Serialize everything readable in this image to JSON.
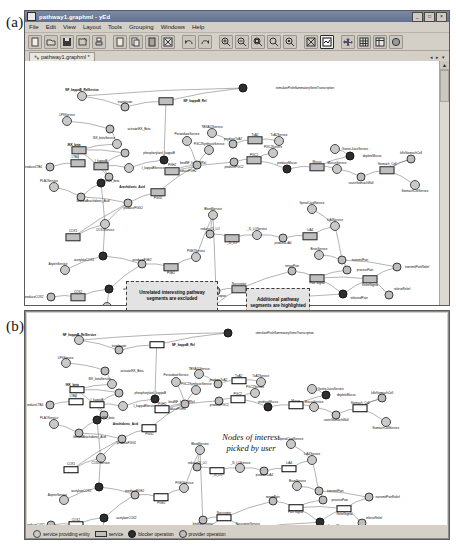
{
  "figure": {
    "panel_a_label": "(a)",
    "panel_b_label": "(b)"
  },
  "window": {
    "title": "pathway1.graphml - yEd",
    "icon": "graph-document-icon",
    "buttons": [
      {
        "name": "minimize-button",
        "glyph": "_"
      },
      {
        "name": "maximize-button",
        "glyph": "□"
      },
      {
        "name": "close-button",
        "glyph": "×"
      }
    ],
    "menus": [
      "File",
      "Edit",
      "View",
      "Layout",
      "Tools",
      "Grouping",
      "Windows",
      "Help"
    ],
    "toolbar": [
      {
        "name": "new-document-button",
        "icon": "new-file-icon"
      },
      {
        "name": "open-document-button",
        "icon": "open-folder-icon"
      },
      {
        "name": "save-document-button",
        "icon": "save-disk-icon"
      },
      {
        "name": "save-as-button",
        "icon": "save-as-icon"
      },
      {
        "name": "print-button",
        "icon": "printer-icon"
      },
      {
        "name": "cut-button",
        "icon": "cut-scissors-icon"
      },
      {
        "name": "copy-button",
        "icon": "copy-pages-icon"
      },
      {
        "name": "paste-button",
        "icon": "paste-clipboard-icon"
      },
      {
        "name": "delete-button",
        "icon": "delete-x-icon"
      },
      {
        "name": "undo-button",
        "icon": "undo-arrow-icon"
      },
      {
        "name": "redo-button",
        "icon": "redo-arrow-icon"
      },
      {
        "name": "zoom-in-button",
        "icon": "zoom-in-icon"
      },
      {
        "name": "zoom-out-button",
        "icon": "zoom-out-icon"
      },
      {
        "name": "zoom-area-button",
        "icon": "zoom-area-icon"
      },
      {
        "name": "zoom-original-button",
        "icon": "zoom-100-icon"
      },
      {
        "name": "zoom-selection-button",
        "icon": "zoom-selection-icon"
      },
      {
        "name": "fit-content-button",
        "icon": "fit-content-icon"
      },
      {
        "name": "fit-page-button",
        "icon": "fit-page-icon"
      },
      {
        "name": "move-tool-button",
        "icon": "move-cross-icon"
      },
      {
        "name": "grid-button",
        "icon": "grid-icon"
      },
      {
        "name": "table-layout-button",
        "icon": "table-icon"
      },
      {
        "name": "properties-button",
        "icon": "properties-circle-icon"
      }
    ],
    "tab": {
      "label": "pathway1.graphml *",
      "icon": "graph-tab-icon"
    },
    "tab_controls": [
      "◂",
      "▸",
      "▾"
    ],
    "scroll": {
      "up_arrow": "▲",
      "down_arrow": "▼"
    }
  },
  "annotations": {
    "callout_excluded": "Unrelated interesting pathway segments are excluded",
    "callout_highlighted": "Additional pathway segments are highlighted",
    "hand_note": "Nodes of interest\npicked by user"
  },
  "legend": {
    "items": [
      {
        "label": "service providing entity",
        "shape": "circle",
        "name": "legend-entity"
      },
      {
        "label": "service",
        "shape": "rounded-box",
        "name": "legend-service"
      },
      {
        "label": "blocker operation",
        "shape": "filled-circle",
        "name": "legend-blocker-operation"
      },
      {
        "label": "provider operation",
        "shape": "circle",
        "name": "legend-provider-operation"
      }
    ]
  },
  "graph": {
    "nodes": [
      {
        "id": "n1",
        "label": "NF_kappaB_RelService",
        "kind": "entity",
        "x": 75,
        "y": 79,
        "lx": 75,
        "ly": 73,
        "bold": true
      },
      {
        "id": "n2",
        "label": "stimulateProInflammatoryGeneTranscription",
        "kind": "op-blk",
        "x": 236,
        "y": 71,
        "lx": 298,
        "ly": 71
      },
      {
        "id": "n3",
        "label": "translocate",
        "kind": "op",
        "x": 118,
        "y": 90,
        "lx": 118,
        "ly": 85
      },
      {
        "id": "n4",
        "label": "NF_kappaB_Rel",
        "kind": "service",
        "x": 159,
        "y": 84,
        "lx": 188,
        "ly": 84,
        "bold": true
      },
      {
        "id": "n5",
        "label": "LPSService",
        "kind": "entity",
        "x": 60,
        "y": 104,
        "lx": 60,
        "ly": 98
      },
      {
        "id": "n6",
        "label": "activateIKK_Beta",
        "kind": "op",
        "x": 103,
        "y": 112,
        "lx": 132,
        "ly": 112
      },
      {
        "id": "n7",
        "label": "IKK_betaService",
        "kind": "entity",
        "x": 110,
        "y": 127,
        "lx": 97,
        "ly": 121
      },
      {
        "id": "n8",
        "label": "PeroxidaseService",
        "kind": "entity",
        "x": 180,
        "y": 124,
        "lx": 180,
        "ly": 117
      },
      {
        "id": "n9",
        "label": "IKK_beta",
        "kind": "service",
        "x": 72,
        "y": 133,
        "lx": 67,
        "ly": 128,
        "bold": true
      },
      {
        "id": "n10",
        "label": "phosphorylateI_kappaB",
        "kind": "op",
        "x": 118,
        "y": 136,
        "lx": 152,
        "ly": 136
      },
      {
        "id": "n11",
        "label": "I_kappaB",
        "kind": "service",
        "x": 94,
        "y": 149,
        "lx": 94,
        "ly": 144
      },
      {
        "id": "n12",
        "label": "I_kappaBService",
        "kind": "entity",
        "x": 122,
        "y": 151,
        "lx": 146,
        "ly": 151
      },
      {
        "id": "n13",
        "label": "bindNF_kappaBRel",
        "kind": "op-blk",
        "x": 157,
        "y": 143,
        "lx": 186,
        "ly": 146
      },
      {
        "id": "n14",
        "label": "LTB4",
        "kind": "service",
        "x": 71,
        "y": 146,
        "lx": 68,
        "ly": 140
      },
      {
        "id": "n15",
        "label": "produceLTB4",
        "kind": "op",
        "x": 43,
        "y": 150,
        "lx": 26,
        "ly": 150
      },
      {
        "id": "n16",
        "label": "toggleIKK_beta",
        "kind": "op",
        "x": 102,
        "y": 160,
        "lx": 102,
        "ly": 164
      },
      {
        "id": "n17",
        "label": "Arachidonic_Acid",
        "kind": "op-blk",
        "x": 94,
        "y": 166,
        "lx": 125,
        "ly": 170,
        "bold": true
      },
      {
        "id": "n18",
        "label": "PLAOService",
        "kind": "entity",
        "x": 47,
        "y": 170,
        "lx": 42,
        "ly": 164
      },
      {
        "id": "n19",
        "label": "liberateArachidonic_Acid",
        "kind": "op",
        "x": 74,
        "y": 180,
        "lx": 86,
        "ly": 184
      },
      {
        "id": "n20",
        "label": "PGG2",
        "kind": "service",
        "x": 151,
        "y": 175,
        "lx": 151,
        "ly": 181
      },
      {
        "id": "n21",
        "label": "producePGG2",
        "kind": "op",
        "x": 121,
        "y": 186,
        "lx": 126,
        "ly": 191
      },
      {
        "id": "n22",
        "label": "COX1Service",
        "kind": "entity",
        "x": 98,
        "y": 207,
        "lx": 98,
        "ly": 213
      },
      {
        "id": "n23",
        "label": "COX1",
        "kind": "service",
        "x": 66,
        "y": 220,
        "lx": 66,
        "ly": 214
      },
      {
        "id": "n24",
        "label": "acetylateCOX1",
        "kind": "op-blk",
        "x": 96,
        "y": 239,
        "lx": 77,
        "ly": 243
      },
      {
        "id": "n25",
        "label": "AspirinService",
        "kind": "entity",
        "x": 58,
        "y": 253,
        "lx": 51,
        "ly": 247
      },
      {
        "id": "n26",
        "label": "producePGE2",
        "kind": "op",
        "x": 135,
        "y": 247,
        "lx": 135,
        "ly": 243
      },
      {
        "id": "n27",
        "label": "PGE2",
        "kind": "service",
        "x": 164,
        "y": 250,
        "lx": 164,
        "ly": 256
      },
      {
        "id": "n28",
        "label": "PGE2Service",
        "kind": "entity",
        "x": 189,
        "y": 240,
        "lx": 189,
        "ly": 234
      },
      {
        "id": "n29",
        "label": "produceCOX2",
        "kind": "op",
        "x": 44,
        "y": 280,
        "lx": 27,
        "ly": 280
      },
      {
        "id": "n30",
        "label": "COX2",
        "kind": "service",
        "x": 71,
        "y": 280,
        "lx": 71,
        "ly": 275
      },
      {
        "id": "n31",
        "label": "acetylateCOX2",
        "kind": "op-blk",
        "x": 102,
        "y": 272,
        "lx": 126,
        "ly": 272
      },
      {
        "id": "n32",
        "label": "COX2Service",
        "kind": "entity",
        "x": 100,
        "y": 290,
        "lx": 120,
        "ly": 290
      },
      {
        "id": "n33",
        "label": "TBXA01Service",
        "kind": "entity",
        "x": 205,
        "y": 116,
        "lx": 205,
        "ly": 110
      },
      {
        "id": "n34",
        "label": "produceTxA2",
        "kind": "op",
        "x": 226,
        "y": 127,
        "lx": 226,
        "ly": 122
      },
      {
        "id": "n35",
        "label": "TxA2",
        "kind": "service",
        "x": 248,
        "y": 123,
        "lx": 248,
        "ly": 118
      },
      {
        "id": "n36",
        "label": "TxA2Service",
        "kind": "entity",
        "x": 272,
        "y": 124,
        "lx": 272,
        "ly": 118
      },
      {
        "id": "n37",
        "label": "PGC2SynthaseService",
        "kind": "entity",
        "x": 202,
        "y": 133,
        "lx": 202,
        "ly": 127
      },
      {
        "id": "n38",
        "label": "PGC2Service",
        "kind": "entity",
        "x": 266,
        "y": 136,
        "lx": 266,
        "ly": 130
      },
      {
        "id": "n39",
        "label": "PGC2",
        "kind": "service",
        "x": 247,
        "y": 143,
        "lx": 247,
        "ly": 138
      },
      {
        "id": "n40",
        "label": "producePGC2",
        "kind": "op",
        "x": 227,
        "y": 145,
        "lx": 227,
        "ly": 150
      },
      {
        "id": "n41",
        "label": "producePGH2",
        "kind": "op",
        "x": 190,
        "y": 148,
        "lx": 180,
        "ly": 154
      },
      {
        "id": "n42",
        "label": "PGH2",
        "kind": "service",
        "x": 165,
        "y": 154,
        "lx": 165,
        "ly": 148
      },
      {
        "id": "n43",
        "label": "produceMucus",
        "kind": "op-blk",
        "x": 280,
        "y": 152,
        "lx": 280,
        "ly": 146
      },
      {
        "id": "n44",
        "label": "Mucus",
        "kind": "service",
        "x": 310,
        "y": 150,
        "lx": 310,
        "ly": 145
      },
      {
        "id": "n45",
        "label": "MucusService",
        "kind": "entity",
        "x": 330,
        "y": 152,
        "lx": 330,
        "ly": 146
      },
      {
        "id": "n46",
        "label": "GastricJuiceService",
        "kind": "entity",
        "x": 328,
        "y": 132,
        "lx": 348,
        "ly": 132
      },
      {
        "id": "n47",
        "label": "depleteMucus",
        "kind": "op-blk",
        "x": 343,
        "y": 139,
        "lx": 365,
        "ly": 139
      },
      {
        "id": "n48",
        "label": "coverStomachWall",
        "kind": "op",
        "x": 354,
        "y": 160,
        "lx": 354,
        "ly": 166
      },
      {
        "id": "n49",
        "label": "Stomach_Cell",
        "kind": "service",
        "x": 380,
        "y": 153,
        "lx": 380,
        "ly": 147
      },
      {
        "id": "n50",
        "label": "killsStomachCell",
        "kind": "op",
        "x": 404,
        "y": 142,
        "lx": 404,
        "ly": 136
      },
      {
        "id": "n51",
        "label": "StomachCellService",
        "kind": "entity",
        "x": 408,
        "y": 168,
        "lx": 408,
        "ly": 174
      },
      {
        "id": "n52",
        "label": "BloodService",
        "kind": "entity",
        "x": 206,
        "y": 198,
        "lx": 206,
        "ly": 192
      },
      {
        "id": "n53",
        "label": "reduce_I5_LO",
        "kind": "op",
        "x": 203,
        "y": 217,
        "lx": 203,
        "ly": 212
      },
      {
        "id": "n54",
        "label": "_I5_LO",
        "kind": "service",
        "x": 225,
        "y": 221,
        "lx": 225,
        "ly": 226
      },
      {
        "id": "n55",
        "label": "_I5_LOService",
        "kind": "entity",
        "x": 250,
        "y": 218,
        "lx": 250,
        "ly": 212
      },
      {
        "id": "n56",
        "label": "produceLtA4",
        "kind": "op",
        "x": 276,
        "y": 221,
        "lx": 276,
        "ly": 226
      },
      {
        "id": "n57",
        "label": "LtA4",
        "kind": "service",
        "x": 303,
        "y": 219,
        "lx": 303,
        "ly": 213
      },
      {
        "id": "n58",
        "label": "LtA4Service",
        "kind": "entity",
        "x": 328,
        "y": 209,
        "lx": 328,
        "ly": 203
      },
      {
        "id": "n59",
        "label": "SpinalCordService",
        "kind": "entity",
        "x": 305,
        "y": 192,
        "lx": 305,
        "ly": 186
      },
      {
        "id": "n60",
        "label": "BrainService",
        "kind": "entity",
        "x": 312,
        "y": 238,
        "lx": 312,
        "ly": 232
      },
      {
        "id": "n61",
        "label": "transmitPain",
        "kind": "op",
        "x": 335,
        "y": 243,
        "lx": 353,
        "ly": 243
      },
      {
        "id": "n62",
        "label": "processPain",
        "kind": "op",
        "x": 340,
        "y": 253,
        "lx": 358,
        "ly": 253
      },
      {
        "id": "n63",
        "label": "sensePain",
        "kind": "op",
        "x": 285,
        "y": 254,
        "lx": 285,
        "ly": 249
      },
      {
        "id": "n64",
        "label": "Pain Signal",
        "kind": "service",
        "x": 310,
        "y": 261,
        "lx": 310,
        "ly": 266
      },
      {
        "id": "n65",
        "label": "ReliefSignal",
        "kind": "service",
        "x": 363,
        "y": 262,
        "lx": 363,
        "ly": 268
      },
      {
        "id": "n66",
        "label": "transmitPainRelief",
        "kind": "op",
        "x": 390,
        "y": 250,
        "lx": 410,
        "ly": 250
      },
      {
        "id": "n67",
        "label": "relieveofPain",
        "kind": "op-blk",
        "x": 336,
        "y": 277,
        "lx": 352,
        "ly": 281
      },
      {
        "id": "n68",
        "label": "relieveRelief",
        "kind": "op",
        "x": 382,
        "y": 278,
        "lx": 395,
        "ly": 272
      },
      {
        "id": "n69",
        "label": "Nociceptor",
        "kind": "service",
        "x": 232,
        "y": 272,
        "lx": 232,
        "ly": 267
      },
      {
        "id": "n70",
        "label": "NociceptorService",
        "kind": "entity",
        "x": 255,
        "y": 285,
        "lx": 258,
        "ly": 279
      },
      {
        "id": "n71",
        "label": "bindNociceptor",
        "kind": "op",
        "x": 209,
        "y": 274,
        "lx": 209,
        "ly": 279
      },
      {
        "id": "n72",
        "label": "bindNociceptor",
        "kind": "op",
        "x": 206,
        "y": 290,
        "lx": 222,
        "ly": 294
      }
    ]
  }
}
